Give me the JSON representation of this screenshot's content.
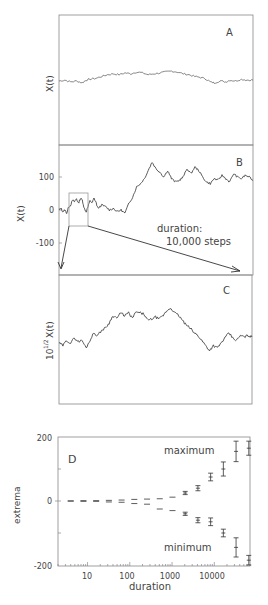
{
  "chart_data": [
    {
      "panel": "A",
      "type": "line",
      "ylabel": "X(t)",
      "title": "",
      "curve": [
        [
          0,
          0
        ],
        [
          3,
          1
        ],
        [
          6,
          -1
        ],
        [
          9,
          0
        ],
        [
          12,
          -2
        ],
        [
          14,
          1
        ],
        [
          16,
          2
        ],
        [
          19,
          3
        ],
        [
          22,
          5
        ],
        [
          25,
          7
        ],
        [
          28,
          8
        ],
        [
          31,
          7
        ],
        [
          34,
          9
        ],
        [
          37,
          8
        ],
        [
          40,
          10
        ],
        [
          43,
          9
        ],
        [
          46,
          7
        ],
        [
          49,
          8
        ],
        [
          52,
          9
        ],
        [
          55,
          10
        ],
        [
          58,
          11
        ],
        [
          61,
          10
        ],
        [
          64,
          8
        ],
        [
          67,
          7
        ],
        [
          70,
          5
        ],
        [
          73,
          4
        ],
        [
          76,
          2
        ],
        [
          78,
          -1
        ],
        [
          80,
          -2
        ],
        [
          83,
          0
        ],
        [
          86,
          -1
        ],
        [
          88,
          1
        ],
        [
          91,
          0
        ],
        [
          94,
          2
        ],
        [
          97,
          1
        ],
        [
          100,
          1
        ]
      ]
    },
    {
      "panel": "B",
      "type": "line",
      "ylabel": "X(t)",
      "yticks": [
        "100",
        "0",
        "-100"
      ],
      "ylim": [
        -190,
        190
      ],
      "annotation": [
        "duration:",
        "10,000 steps"
      ],
      "curve": [
        [
          0,
          0
        ],
        [
          1,
          5
        ],
        [
          2,
          -5
        ],
        [
          3,
          0
        ],
        [
          4,
          -10
        ],
        [
          5,
          10
        ],
        [
          6,
          15
        ],
        [
          7,
          30
        ],
        [
          8,
          25
        ],
        [
          9,
          35
        ],
        [
          10,
          20
        ],
        [
          11,
          35
        ],
        [
          12,
          30
        ],
        [
          13,
          5
        ],
        [
          14,
          -5
        ],
        [
          15,
          10
        ],
        [
          16,
          30
        ],
        [
          17,
          20
        ],
        [
          18,
          35
        ],
        [
          19,
          25
        ],
        [
          20,
          5
        ],
        [
          22,
          15
        ],
        [
          24,
          10
        ],
        [
          26,
          0
        ],
        [
          28,
          5
        ],
        [
          30,
          -5
        ],
        [
          32,
          0
        ],
        [
          34,
          -10
        ],
        [
          36,
          20
        ],
        [
          38,
          40
        ],
        [
          40,
          70
        ],
        [
          42,
          80
        ],
        [
          44,
          95
        ],
        [
          46,
          120
        ],
        [
          48,
          145
        ],
        [
          50,
          125
        ],
        [
          52,
          115
        ],
        [
          54,
          100
        ],
        [
          56,
          120
        ],
        [
          58,
          95
        ],
        [
          60,
          85
        ],
        [
          62,
          90
        ],
        [
          64,
          100
        ],
        [
          66,
          125
        ],
        [
          68,
          110
        ],
        [
          70,
          130
        ],
        [
          72,
          120
        ],
        [
          74,
          100
        ],
        [
          76,
          85
        ],
        [
          78,
          80
        ],
        [
          80,
          95
        ],
        [
          82,
          90
        ],
        [
          84,
          105
        ],
        [
          86,
          95
        ],
        [
          88,
          85
        ],
        [
          90,
          110
        ],
        [
          92,
          100
        ],
        [
          94,
          95
        ],
        [
          96,
          105
        ],
        [
          98,
          100
        ],
        [
          100,
          90
        ]
      ],
      "zoom_box": {
        "x_range": [
          5,
          15
        ],
        "y_range": [
          -45,
          55
        ]
      }
    },
    {
      "panel": "C",
      "type": "line",
      "ylabel": "10^1/2 X(t)",
      "curve": [
        [
          0,
          0
        ],
        [
          2,
          -5
        ],
        [
          4,
          5
        ],
        [
          6,
          0
        ],
        [
          8,
          10
        ],
        [
          10,
          3
        ],
        [
          12,
          5
        ],
        [
          14,
          -10
        ],
        [
          16,
          5
        ],
        [
          18,
          20
        ],
        [
          20,
          15
        ],
        [
          22,
          25
        ],
        [
          24,
          30
        ],
        [
          26,
          40
        ],
        [
          28,
          55
        ],
        [
          30,
          50
        ],
        [
          32,
          60
        ],
        [
          34,
          55
        ],
        [
          36,
          60
        ],
        [
          38,
          50
        ],
        [
          40,
          62
        ],
        [
          42,
          60
        ],
        [
          44,
          58
        ],
        [
          46,
          45
        ],
        [
          48,
          48
        ],
        [
          50,
          52
        ],
        [
          52,
          48
        ],
        [
          54,
          55
        ],
        [
          56,
          65
        ],
        [
          58,
          70
        ],
        [
          60,
          60
        ],
        [
          62,
          55
        ],
        [
          64,
          45
        ],
        [
          66,
          35
        ],
        [
          68,
          30
        ],
        [
          70,
          20
        ],
        [
          72,
          15
        ],
        [
          74,
          5
        ],
        [
          76,
          -5
        ],
        [
          78,
          -15
        ],
        [
          80,
          -5
        ],
        [
          82,
          -10
        ],
        [
          84,
          0
        ],
        [
          86,
          10
        ],
        [
          88,
          20
        ],
        [
          90,
          10
        ],
        [
          92,
          5
        ],
        [
          94,
          15
        ],
        [
          96,
          12
        ],
        [
          98,
          15
        ],
        [
          100,
          12
        ]
      ]
    },
    {
      "panel": "D",
      "type": "scatter",
      "xlabel": "duration",
      "ylabel": "extrema",
      "xscale": "log",
      "xticks": [
        "10",
        "100",
        "1000",
        "10000"
      ],
      "yticks": [
        "200",
        "0",
        "-200"
      ],
      "ylim": [
        -200,
        200
      ],
      "xlim": [
        2,
        70000
      ],
      "legend": {
        "maximum": "maximum",
        "minimum": "minimum"
      },
      "series": [
        {
          "name": "maximum",
          "x": [
            4,
            8,
            16,
            32,
            64,
            128,
            256,
            512,
            1024,
            2048,
            4096,
            8192,
            16384,
            32768,
            65536
          ],
          "values": [
            0,
            1,
            1,
            2,
            3,
            5,
            6,
            7,
            12,
            25,
            40,
            75,
            100,
            155,
            165
          ],
          "err": [
            0,
            0,
            0,
            0,
            0,
            1,
            1,
            2,
            3,
            5,
            8,
            12,
            22,
            32,
            22
          ]
        },
        {
          "name": "minimum",
          "x": [
            4,
            8,
            16,
            32,
            64,
            128,
            256,
            512,
            1024,
            2048,
            4096,
            8192,
            16384,
            32768,
            65536
          ],
          "values": [
            0,
            -1,
            -1,
            -3,
            -4,
            -8,
            -10,
            -25,
            -30,
            -40,
            -60,
            -65,
            -100,
            -145,
            -185
          ],
          "err": [
            0,
            0,
            0,
            0,
            0,
            1,
            1,
            2,
            3,
            5,
            8,
            12,
            12,
            30,
            15
          ]
        }
      ]
    }
  ],
  "labels": {
    "panel_a": "A",
    "panel_b": "B",
    "panel_c": "C",
    "panel_d": "D",
    "ylabel_a": "X(t)",
    "ylabel_b": "X(t)",
    "ylabel_c_base": "10",
    "ylabel_c_exp": "1/2",
    "ylabel_c_rest": "X(t)",
    "b_tick_100": "100",
    "b_tick_0": "0",
    "b_tick_m100": "-100",
    "duration_line1": "duration:",
    "duration_line2": "10,000 steps",
    "d_tick_200": "200",
    "d_tick_0": "0",
    "d_tick_m200": "-200",
    "d_xtick_10": "10",
    "d_xtick_100": "100",
    "d_xtick_1000": "1000",
    "d_xtick_10000": "10000",
    "d_xlabel": "duration",
    "d_ylabel": "extrema",
    "maximum": "maximum",
    "minimum": "minimum"
  }
}
